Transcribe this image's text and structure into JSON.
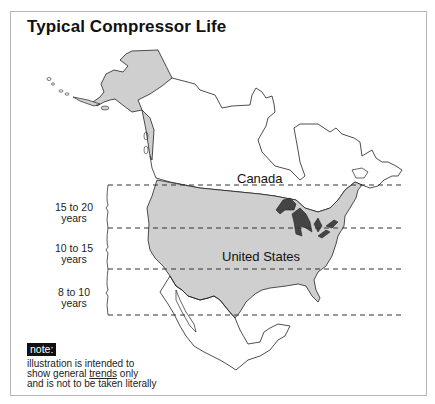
{
  "title": "Typical Compressor Life",
  "regions": {
    "canada": "Canada",
    "united_states": "United States"
  },
  "bands": [
    {
      "line1": "15 to 20",
      "line2": "years"
    },
    {
      "line1": "10 to 15",
      "line2": "years"
    },
    {
      "line1": "8 to 10",
      "line2": "years"
    }
  ],
  "note": {
    "tag": "note:",
    "line1": "illustration is intended to",
    "line2_pre": "show general ",
    "line2_emph": "trends",
    "line2_post": " only",
    "line3": "and is not to be taken literally"
  },
  "colors": {
    "us_fill": "#cfcfcf",
    "great_lakes": "#444444",
    "outline": "#222222",
    "frame": "#b5b5b5"
  }
}
